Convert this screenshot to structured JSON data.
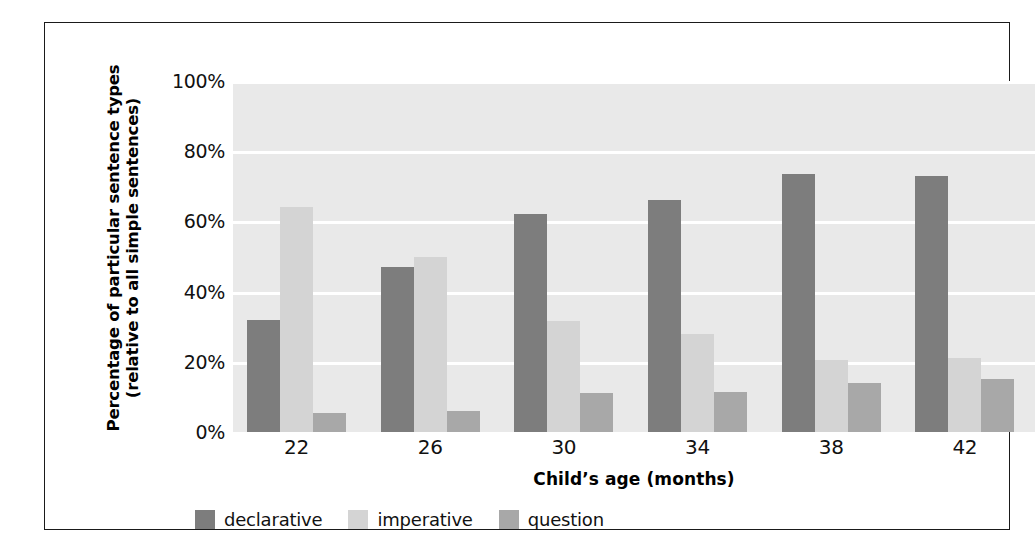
{
  "chart_data": {
    "type": "bar",
    "title": "",
    "xlabel": "Child’s age (months)",
    "ylabel_line1": "Percentage of particular sentence types",
    "ylabel_line2": "(relative to all simple sentences)",
    "categories": [
      "22",
      "26",
      "30",
      "34",
      "38",
      "42"
    ],
    "series": [
      {
        "name": "declarative",
        "color": "#7d7d7d",
        "values": [
          32,
          47,
          62,
          66,
          73.5,
          73
        ]
      },
      {
        "name": "imperative",
        "color": "#d4d4d4",
        "values": [
          64,
          50,
          31.5,
          28,
          20.5,
          21
        ]
      },
      {
        "name": "question",
        "color": "#a8a8a8",
        "values": [
          5.5,
          6,
          11,
          11.5,
          14,
          15
        ]
      }
    ],
    "ylim": [
      0,
      100
    ],
    "yticks": [
      0,
      20,
      40,
      60,
      80,
      100
    ],
    "ytick_labels": [
      "0%",
      "20%",
      "40%",
      "60%",
      "80%",
      "100%"
    ],
    "grid": true,
    "grid_color": "#ffffff",
    "plot_background": "#e9e9e9",
    "legend_position": "bottom"
  },
  "legend": {
    "items": [
      {
        "label": "declarative",
        "color": "#7d7d7d"
      },
      {
        "label": "imperative",
        "color": "#d4d4d4"
      },
      {
        "label": "question",
        "color": "#a8a8a8"
      }
    ]
  }
}
